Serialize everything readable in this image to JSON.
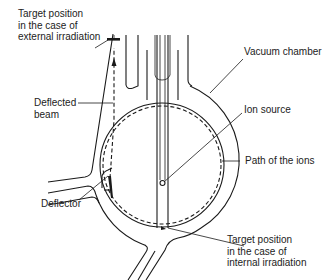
{
  "figure": {
    "type": "cyclotron-schematic",
    "labels": {
      "target_external": [
        "Target position",
        "in the case of",
        "external irradiation"
      ],
      "vacuum_chamber": "Vacuum chamber",
      "deflected_beam": [
        "Deflected",
        "beam"
      ],
      "ion_source": "Ion source",
      "path_of_ions": "Path of the ions",
      "deflector": "Deflector",
      "target_internal": [
        "Target position",
        "in the case of",
        "internal irradiation"
      ]
    },
    "colors": {
      "line": "#1a1a1a",
      "text": "#222222",
      "background": "#ffffff"
    }
  }
}
